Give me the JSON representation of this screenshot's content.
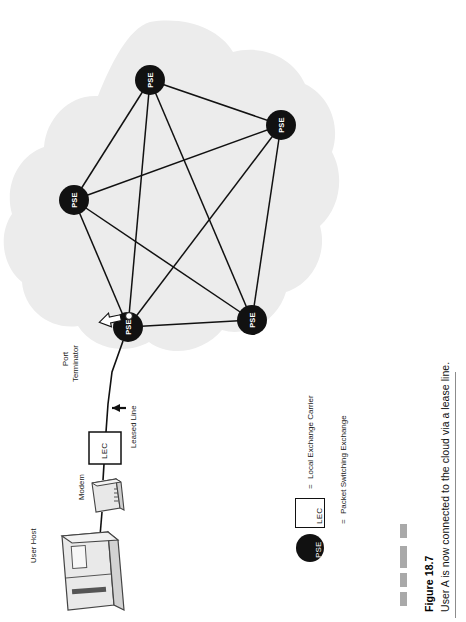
{
  "figure": {
    "number": "Figure 18.7",
    "caption": "User A is now connected to the cloud via a lease line."
  },
  "diagram": {
    "type": "network-topology",
    "orientation": "rotated-90-ccw",
    "cloud": {
      "fill": "#ececec",
      "label": "packet switching cloud"
    },
    "node_label": "PSE",
    "node_color": "#111111",
    "node_text_color": "#ffffff",
    "nodes": [
      {
        "id": "pse-top",
        "label": "PSE",
        "x": 150,
        "y": 80,
        "r": 15
      },
      {
        "id": "pse-right",
        "label": "PSE",
        "x": 281,
        "y": 125,
        "r": 15
      },
      {
        "id": "pse-left",
        "label": "PSE",
        "x": 74,
        "y": 200,
        "r": 15
      },
      {
        "id": "pse-bottom-left",
        "label": "PSE",
        "x": 128,
        "y": 327,
        "r": 15
      },
      {
        "id": "pse-bottom-right",
        "label": "PSE",
        "x": 252,
        "y": 320,
        "r": 15
      }
    ],
    "links": [
      [
        "pse-top",
        "pse-right"
      ],
      [
        "pse-top",
        "pse-left"
      ],
      [
        "pse-top",
        "pse-bottom-left"
      ],
      [
        "pse-top",
        "pse-bottom-right"
      ],
      [
        "pse-right",
        "pse-left"
      ],
      [
        "pse-right",
        "pse-bottom-left"
      ],
      [
        "pse-right",
        "pse-bottom-right"
      ],
      [
        "pse-left",
        "pse-bottom-left"
      ],
      [
        "pse-left",
        "pse-bottom-right"
      ],
      [
        "pse-bottom-left",
        "pse-bottom-right"
      ]
    ],
    "annotations": {
      "port_terminator": "Port\nTerminator",
      "port_terminator_line1": "Port",
      "port_terminator_line2": "Terminator",
      "leased_line": "Leased Line",
      "modem": "Modem",
      "user_host": "User Host",
      "lec_box": "LEC"
    }
  },
  "legend": {
    "items": [
      {
        "symbol": "LEC",
        "symbol_kind": "box",
        "equals": "=",
        "text": "Local Exchange Carrier"
      },
      {
        "symbol": "PSE",
        "symbol_kind": "circle",
        "equals": "=",
        "text": "Packet Switching Exchange"
      }
    ]
  },
  "decor": {
    "dash_color": "#a9a9a9",
    "rule_color": "#8c8c8c",
    "dash_count": 4
  }
}
